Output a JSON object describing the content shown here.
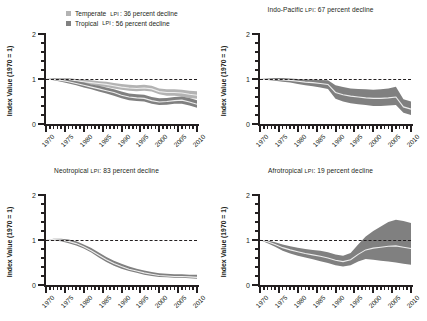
{
  "figure": {
    "ylabel": "Index Value (1970 = 1)",
    "y_ticks": [
      "0",
      "1",
      "2"
    ],
    "x_ticks": [
      "1970",
      "1975",
      "1980",
      "1985",
      "1990",
      "1995",
      "2000",
      "2005",
      "2010"
    ],
    "colors": {
      "temperate_band": "#b3b3b3",
      "tropical_band": "#808080",
      "median_line": "#ededed",
      "axis": "#231f20",
      "background": "#ffffff"
    }
  },
  "legend": {
    "items": [
      {
        "label": "Temperate",
        "lpi": "LPI",
        "detail": ": 36 percent decline",
        "color": "#b3b3b3"
      },
      {
        "label": "Tropical",
        "lpi": "LPI",
        "detail": ": 56 percent decline",
        "color": "#808080"
      }
    ]
  },
  "panels": {
    "temperate_tropical": {
      "title_main": "",
      "title_lpi": "",
      "title_detail": ""
    },
    "indo_pacific": {
      "title_main": "Indo-Pacific ",
      "title_lpi": "LPI",
      "title_detail": ": 67 percent decline"
    },
    "neotropical": {
      "title_main": "Neotropical ",
      "title_lpi": "LPI",
      "title_detail": ": 83 percent decline"
    },
    "afrotropical": {
      "title_main": "Afrotropical ",
      "title_lpi": "LPI",
      "title_detail": ": 19 percent decline"
    }
  },
  "chart_data": {
    "type": "line",
    "xlabel": "",
    "ylabel": "Index Value (1970 = 1)",
    "xlim": [
      1970,
      2010
    ],
    "ylim": [
      0,
      2
    ],
    "grid": false,
    "reference_line": {
      "y": 1,
      "style": "dashed",
      "color": "#231f20"
    },
    "legend_position": "top-left-panel",
    "x": [
      1970,
      1972,
      1974,
      1976,
      1978,
      1980,
      1982,
      1984,
      1986,
      1988,
      1990,
      1992,
      1994,
      1996,
      1998,
      2000,
      2002,
      2004,
      2006,
      2008,
      2010
    ],
    "panels": [
      {
        "name": "Temperate and Tropical LPI",
        "position": "top-left",
        "series": [
          {
            "name": "Temperate LPI",
            "summary": "36 percent decline",
            "color": "#b3b3b3",
            "median": [
              1.0,
              1.0,
              0.99,
              0.98,
              0.96,
              0.94,
              0.92,
              0.9,
              0.88,
              0.85,
              0.82,
              0.8,
              0.79,
              0.8,
              0.78,
              0.72,
              0.7,
              0.7,
              0.69,
              0.66,
              0.64
            ],
            "lower": [
              1.0,
              0.98,
              0.96,
              0.94,
              0.92,
              0.89,
              0.87,
              0.84,
              0.82,
              0.79,
              0.76,
              0.74,
              0.73,
              0.74,
              0.72,
              0.66,
              0.63,
              0.63,
              0.61,
              0.58,
              0.56
            ],
            "upper": [
              1.0,
              1.02,
              1.02,
              1.02,
              1.0,
              0.99,
              0.97,
              0.95,
              0.94,
              0.91,
              0.89,
              0.87,
              0.86,
              0.87,
              0.85,
              0.79,
              0.77,
              0.77,
              0.76,
              0.74,
              0.73
            ]
          },
          {
            "name": "Tropical LPI",
            "summary": "56 percent decline",
            "color": "#808080",
            "median": [
              1.0,
              0.99,
              0.97,
              0.94,
              0.9,
              0.86,
              0.82,
              0.78,
              0.74,
              0.7,
              0.64,
              0.6,
              0.58,
              0.57,
              0.52,
              0.49,
              0.5,
              0.52,
              0.53,
              0.49,
              0.44
            ],
            "lower": [
              1.0,
              0.97,
              0.94,
              0.9,
              0.86,
              0.81,
              0.77,
              0.72,
              0.68,
              0.63,
              0.57,
              0.53,
              0.51,
              0.5,
              0.45,
              0.42,
              0.43,
              0.45,
              0.45,
              0.41,
              0.36
            ],
            "upper": [
              1.0,
              1.01,
              1.0,
              0.98,
              0.95,
              0.92,
              0.88,
              0.85,
              0.81,
              0.77,
              0.72,
              0.68,
              0.66,
              0.65,
              0.6,
              0.57,
              0.58,
              0.6,
              0.61,
              0.58,
              0.53
            ]
          }
        ]
      },
      {
        "name": "Indo-Pacific LPI",
        "position": "top-right",
        "summary": "67 percent decline",
        "series": [
          {
            "name": "Indo-Pacific LPI",
            "color": "#808080",
            "median": [
              1.0,
              1.0,
              0.99,
              0.98,
              0.97,
              0.95,
              0.93,
              0.92,
              0.9,
              0.88,
              0.7,
              0.65,
              0.62,
              0.6,
              0.58,
              0.57,
              0.57,
              0.58,
              0.6,
              0.38,
              0.33
            ],
            "lower": [
              1.0,
              0.98,
              0.96,
              0.94,
              0.92,
              0.89,
              0.86,
              0.84,
              0.81,
              0.78,
              0.56,
              0.5,
              0.46,
              0.44,
              0.42,
              0.4,
              0.4,
              0.41,
              0.42,
              0.25,
              0.2
            ],
            "upper": [
              1.0,
              1.02,
              1.02,
              1.02,
              1.01,
              1.0,
              0.99,
              0.99,
              0.98,
              0.97,
              0.86,
              0.82,
              0.79,
              0.78,
              0.77,
              0.76,
              0.77,
              0.79,
              0.83,
              0.55,
              0.5
            ]
          }
        ]
      },
      {
        "name": "Neotropical LPI",
        "position": "bottom-left",
        "summary": "83 percent decline",
        "series": [
          {
            "name": "Neotropical LPI",
            "color": "#808080",
            "median": [
              1.0,
              1.01,
              1.0,
              0.97,
              0.92,
              0.85,
              0.76,
              0.66,
              0.56,
              0.48,
              0.41,
              0.35,
              0.31,
              0.27,
              0.24,
              0.21,
              0.2,
              0.19,
              0.19,
              0.18,
              0.17
            ],
            "lower": [
              1.0,
              0.99,
              0.97,
              0.93,
              0.88,
              0.81,
              0.72,
              0.61,
              0.51,
              0.43,
              0.36,
              0.31,
              0.27,
              0.23,
              0.2,
              0.18,
              0.17,
              0.16,
              0.16,
              0.15,
              0.14
            ],
            "upper": [
              1.0,
              1.03,
              1.03,
              1.01,
              0.97,
              0.9,
              0.82,
              0.72,
              0.62,
              0.54,
              0.47,
              0.41,
              0.36,
              0.32,
              0.29,
              0.26,
              0.25,
              0.24,
              0.24,
              0.23,
              0.23
            ]
          }
        ]
      },
      {
        "name": "Afrotropical LPI",
        "position": "bottom-right",
        "summary": "19 percent decline",
        "series": [
          {
            "name": "Afrotropical LPI",
            "color": "#808080",
            "median": [
              1.0,
              0.96,
              0.9,
              0.83,
              0.78,
              0.74,
              0.7,
              0.67,
              0.64,
              0.6,
              0.55,
              0.52,
              0.56,
              0.68,
              0.78,
              0.82,
              0.84,
              0.86,
              0.87,
              0.84,
              0.81
            ],
            "lower": [
              1.0,
              0.93,
              0.85,
              0.76,
              0.7,
              0.65,
              0.61,
              0.57,
              0.53,
              0.49,
              0.44,
              0.41,
              0.44,
              0.52,
              0.58,
              0.56,
              0.54,
              0.52,
              0.5,
              0.47,
              0.45
            ],
            "upper": [
              1.0,
              0.99,
              0.95,
              0.9,
              0.86,
              0.83,
              0.8,
              0.78,
              0.76,
              0.73,
              0.68,
              0.65,
              0.71,
              0.9,
              1.08,
              1.2,
              1.3,
              1.4,
              1.45,
              1.42,
              1.38
            ]
          }
        ]
      }
    ]
  }
}
